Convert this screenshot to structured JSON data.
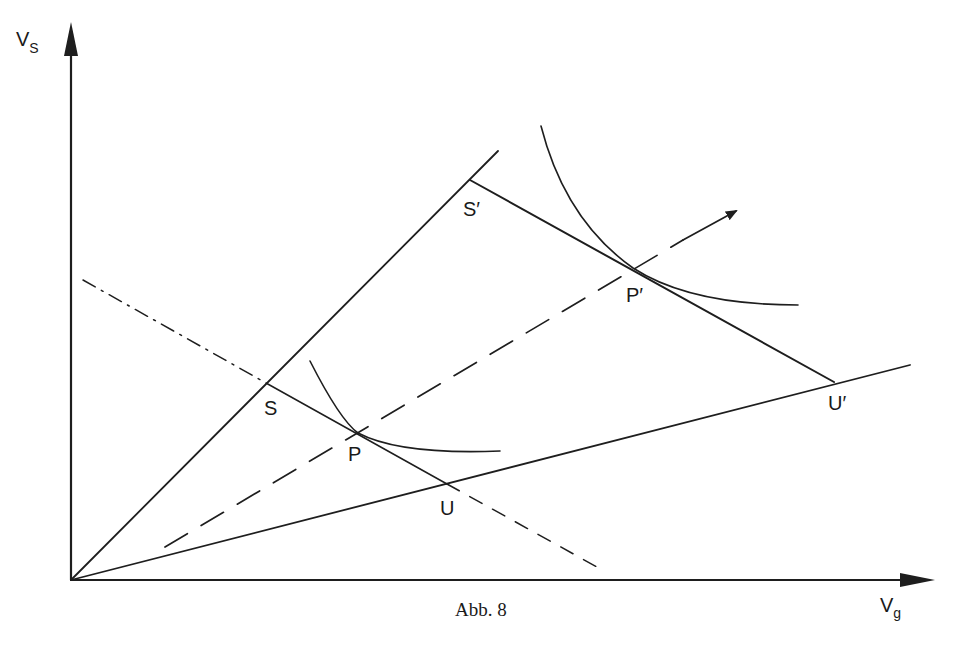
{
  "figure": {
    "caption": "Abb. 8",
    "axes": {
      "y_label": "V",
      "y_label_sub": "S",
      "x_label": "V",
      "x_label_sub": "g"
    },
    "points": {
      "S": "S",
      "P": "P",
      "U": "U",
      "S_prime": "S′",
      "P_prime": "P′",
      "U_prime": "U′"
    },
    "colors": {
      "ink": "#1e1e1e",
      "background": "#ffffff"
    }
  }
}
